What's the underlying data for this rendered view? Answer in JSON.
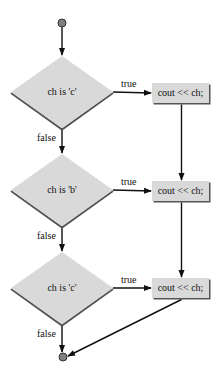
{
  "diagram": {
    "type": "flowchart",
    "colors": {
      "background": "#ffffff",
      "shape_fill": "#d9d9d9",
      "shape_shadow": "#555555",
      "line": "#111111",
      "terminal_fill": "#808080",
      "terminal_stroke": "#333333"
    },
    "start": {
      "x": 62,
      "y": 23,
      "r": 4
    },
    "end": {
      "x": 63,
      "y": 357,
      "r": 4
    },
    "decisions": [
      {
        "label": "ch is 'c'",
        "cx": 62,
        "cy": 92,
        "w": 102,
        "h": 72,
        "true_label": "true",
        "false_label": "false"
      },
      {
        "label": "ch is 'b'",
        "cx": 62,
        "cy": 190,
        "w": 102,
        "h": 72,
        "true_label": "true",
        "false_label": "false"
      },
      {
        "label": "ch is 'c'",
        "cx": 62,
        "cy": 288,
        "w": 102,
        "h": 72,
        "true_label": "true",
        "false_label": "false"
      }
    ],
    "actions": [
      {
        "label": "cout << ch;",
        "x": 152,
        "y": 83,
        "w": 57,
        "h": 20
      },
      {
        "label": "cout << ch;",
        "x": 152,
        "y": 181,
        "w": 57,
        "h": 20
      },
      {
        "label": "cout << ch;",
        "x": 152,
        "y": 278,
        "w": 57,
        "h": 20
      }
    ]
  }
}
